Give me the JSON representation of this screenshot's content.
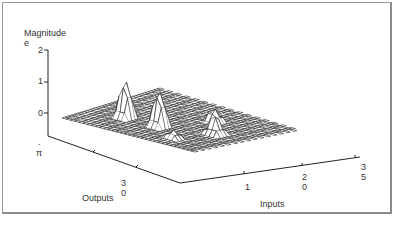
{
  "chart_data": {
    "type": "surface3d",
    "title": "",
    "zlabel": "Magnitude",
    "zlabel_suffix": "e",
    "xlabel": "Inputs",
    "ylabel": "Outputs",
    "z_ticks": [
      "2",
      "1",
      "0",
      "-"
    ],
    "z_bottom_label": "π",
    "x_ticks": [
      {
        "top": "1",
        "bottom": ""
      },
      {
        "top": "2",
        "bottom": "0"
      },
      {
        "top": "3",
        "bottom": "5"
      }
    ],
    "y_ticks": [
      {
        "top": "3",
        "bottom": "0"
      }
    ],
    "zlim": [
      -0.3,
      2
    ],
    "peaks": [
      {
        "label": "peak-1",
        "x": 0.25,
        "y": 0.3,
        "z": 1.4
      },
      {
        "label": "peak-2",
        "x": 0.5,
        "y": 0.3,
        "z": 1.35
      },
      {
        "label": "peak-3",
        "x": 0.62,
        "y": 0.68,
        "z": 0.45
      },
      {
        "label": "peak-4",
        "x": 0.8,
        "y": 0.45,
        "z": 0.7
      },
      {
        "label": "peak-5",
        "x": 0.72,
        "y": 0.15,
        "z": 0.3
      }
    ],
    "grid": "wireframe mesh",
    "grid_size": [
      16,
      16
    ]
  },
  "colors": {
    "line": "#222222",
    "frame": "#9a9a9a",
    "text": "#333333"
  }
}
